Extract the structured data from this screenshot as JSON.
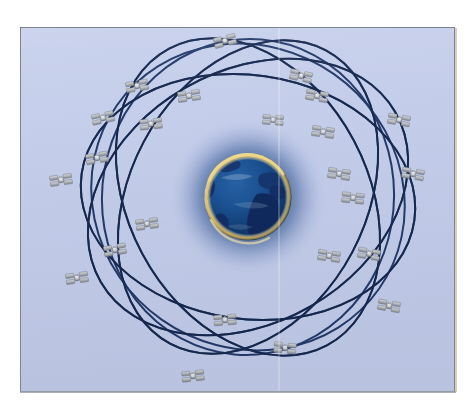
{
  "figure": {
    "caption": "Illustration of a global navigation satellite constellation: multiple inclined orbital planes, each carrying several satellites, encircling a rendered Earth centred on the Atlantic Ocean, Europe and Africa.",
    "medium": "raster illustration on light periwinkle background with thin grey frame"
  },
  "colors": {
    "page_background": "#ffffff",
    "plate_background": "#c4cdea",
    "plate_border": "#7e848f",
    "orbit_line": "#1d3565",
    "orbit_line_dark": "#16274c",
    "earth_ocean": "#1f5fa8",
    "earth_ocean_deep": "#123a72",
    "earth_land": "#16306a",
    "earth_land_dark": "#0e2350",
    "earth_rim_glow": "#e8c45a",
    "earth_rim_highlight": "#f2e6b4",
    "earth_halo": "#2a4f93",
    "satellite_panel": "#b9bcc0",
    "satellite_panel_shadow": "#7e8287",
    "satellite_body": "#e8e9ea",
    "satellite_body_shadow": "#6d7176",
    "scan_seam": "#ffffff",
    "bottom_edge_shadow": "#9aa0ab",
    "right_edge_shadow": "#b9a77a"
  },
  "plate": {
    "x": 20,
    "y": 27,
    "width": 435,
    "height": 365
  },
  "earth": {
    "label": "Earth",
    "center_x": 227,
    "center_y": 169,
    "radius": 42,
    "halo_radius": 78,
    "visible_region": "North Atlantic, Europe, West Africa, South America edge",
    "terminator_note": "bright golden atmospheric limb along the upper-right and lower arc"
  },
  "orbits": {
    "count": 6,
    "description": "six inclined elliptical orbital planes drawn as thin navy ellipses",
    "items": [
      {
        "id": "orbit-1",
        "rx": 168,
        "ry": 122,
        "rotate": 8,
        "stroke_width": 2.0
      },
      {
        "id": "orbit-2",
        "rx": 168,
        "ry": 120,
        "rotate": 62,
        "stroke_width": 2.0
      },
      {
        "id": "orbit-3",
        "rx": 166,
        "ry": 118,
        "rotate": 118,
        "stroke_width": 2.0
      },
      {
        "id": "orbit-4",
        "rx": 170,
        "ry": 126,
        "rotate": 150,
        "stroke_width": 2.0
      },
      {
        "id": "orbit-5",
        "rx": 160,
        "ry": 150,
        "rotate": 35,
        "stroke_width": 2.0
      },
      {
        "id": "orbit-6",
        "rx": 158,
        "ry": 146,
        "rotate": 95,
        "stroke_width": 2.0
      }
    ]
  },
  "satellites": {
    "count": 24,
    "label": "satellite",
    "items": [
      {
        "id": "sat-01",
        "x": 204,
        "y": 13,
        "scale": 1.0,
        "rotate": -14
      },
      {
        "id": "sat-02",
        "x": 116,
        "y": 58,
        "scale": 1.0,
        "rotate": -10
      },
      {
        "id": "sat-03",
        "x": 280,
        "y": 48,
        "scale": 1.0,
        "rotate": 12
      },
      {
        "id": "sat-04",
        "x": 168,
        "y": 68,
        "scale": 1.0,
        "rotate": -8
      },
      {
        "id": "sat-05",
        "x": 296,
        "y": 68,
        "scale": 1.0,
        "rotate": 10
      },
      {
        "id": "sat-06",
        "x": 82,
        "y": 90,
        "scale": 1.0,
        "rotate": -12
      },
      {
        "id": "sat-07",
        "x": 130,
        "y": 96,
        "scale": 1.0,
        "rotate": -6
      },
      {
        "id": "sat-08",
        "x": 378,
        "y": 92,
        "scale": 1.0,
        "rotate": 10
      },
      {
        "id": "sat-09",
        "x": 252,
        "y": 92,
        "scale": 0.94,
        "rotate": 4
      },
      {
        "id": "sat-10",
        "x": 302,
        "y": 104,
        "scale": 1.0,
        "rotate": 8
      },
      {
        "id": "sat-11",
        "x": 76,
        "y": 130,
        "scale": 1.0,
        "rotate": -10
      },
      {
        "id": "sat-12",
        "x": 40,
        "y": 152,
        "scale": 1.0,
        "rotate": -8
      },
      {
        "id": "sat-13",
        "x": 318,
        "y": 146,
        "scale": 1.0,
        "rotate": 8
      },
      {
        "id": "sat-14",
        "x": 392,
        "y": 146,
        "scale": 1.0,
        "rotate": 10
      },
      {
        "id": "sat-15",
        "x": 332,
        "y": 170,
        "scale": 1.0,
        "rotate": 6
      },
      {
        "id": "sat-16",
        "x": 126,
        "y": 196,
        "scale": 1.0,
        "rotate": -8
      },
      {
        "id": "sat-17",
        "x": 94,
        "y": 222,
        "scale": 1.0,
        "rotate": -10
      },
      {
        "id": "sat-18",
        "x": 308,
        "y": 228,
        "scale": 1.0,
        "rotate": 8
      },
      {
        "id": "sat-19",
        "x": 348,
        "y": 226,
        "scale": 1.0,
        "rotate": 10
      },
      {
        "id": "sat-20",
        "x": 56,
        "y": 250,
        "scale": 1.0,
        "rotate": -8
      },
      {
        "id": "sat-21",
        "x": 368,
        "y": 278,
        "scale": 1.0,
        "rotate": 10
      },
      {
        "id": "sat-22",
        "x": 204,
        "y": 292,
        "scale": 1.0,
        "rotate": -4
      },
      {
        "id": "sat-23",
        "x": 264,
        "y": 320,
        "scale": 1.0,
        "rotate": 6
      },
      {
        "id": "sat-24",
        "x": 172,
        "y": 348,
        "scale": 1.0,
        "rotate": -6
      }
    ]
  }
}
